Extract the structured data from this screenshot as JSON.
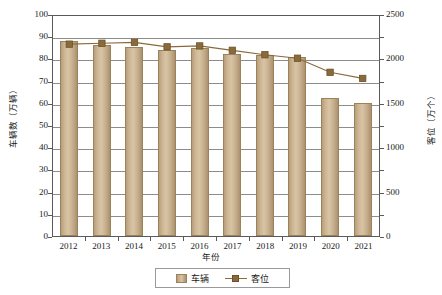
{
  "chart_data": {
    "type": "bar",
    "title": "",
    "xlabel": "年份",
    "ylabel": "车辆数（万辆）",
    "ylabel_right": "客位（万个）",
    "categories": [
      "2012",
      "2013",
      "2014",
      "2015",
      "2016",
      "2017",
      "2018",
      "2019",
      "2020",
      "2021"
    ],
    "ylim": [
      0,
      100
    ],
    "ylim_right": [
      0,
      2500
    ],
    "yticks": [
      100,
      90,
      80,
      70,
      60,
      50,
      40,
      30,
      20,
      10,
      0
    ],
    "yticks_right": [
      2500,
      2000,
      1500,
      1000,
      500,
      0
    ],
    "grid": true,
    "legend_position": "bottom",
    "series": [
      {
        "name": "车辆",
        "type": "bar",
        "axis": "left",
        "unit": "万辆",
        "color": "#cdb694",
        "values": [
          88,
          86,
          85,
          84,
          84.5,
          82,
          81.5,
          80.5,
          62,
          60
        ]
      },
      {
        "name": "客位",
        "type": "line",
        "axis": "right",
        "unit": "万个",
        "color": "#8a6a3a",
        "values": [
          2180,
          2190,
          2200,
          2150,
          2160,
          2110,
          2060,
          2020,
          1860,
          1790
        ]
      }
    ]
  },
  "legend": {
    "items": [
      {
        "label": "车辆",
        "marker": "square-swatch"
      },
      {
        "label": "客位",
        "marker": "line-with-square-marker"
      }
    ]
  },
  "axes": {
    "x_title": "年份",
    "y_left_title": "车辆数（万辆）",
    "y_right_title": "客位（万个）"
  }
}
